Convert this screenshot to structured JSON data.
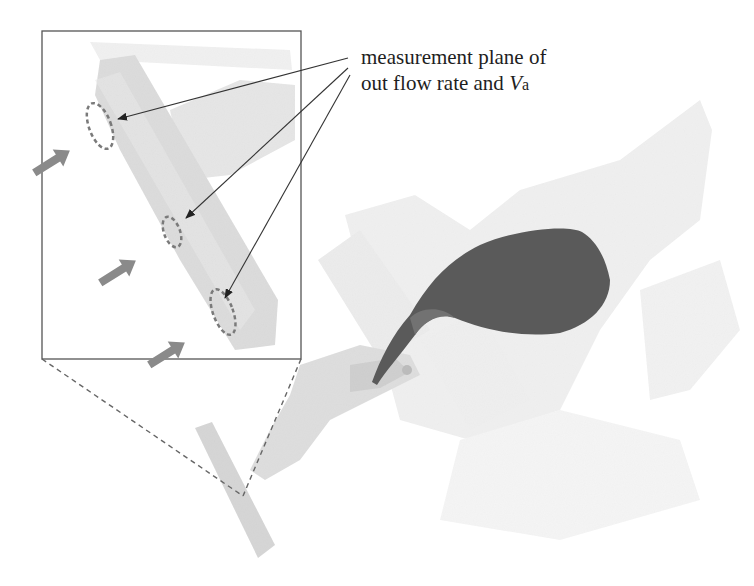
{
  "annotation": {
    "line1": "measurement plane of",
    "line2_prefix": "out flow rate and ",
    "line2_var": "V",
    "line2_sub": "a"
  },
  "figure": {
    "inset_box": {
      "x": 42,
      "y": 31,
      "w": 259,
      "h": 328
    },
    "measurement_planes": 3,
    "outflow_arrows": 3
  },
  "colors": {
    "molten_metal": "#5a5a5a",
    "mold_light": "#e6e6e6",
    "mold_mid": "#d4d4d4",
    "arrow": "#8a8a8a",
    "plane_dash": "#7a7a7a",
    "line": "#333333",
    "text": "#1e1e1e"
  }
}
